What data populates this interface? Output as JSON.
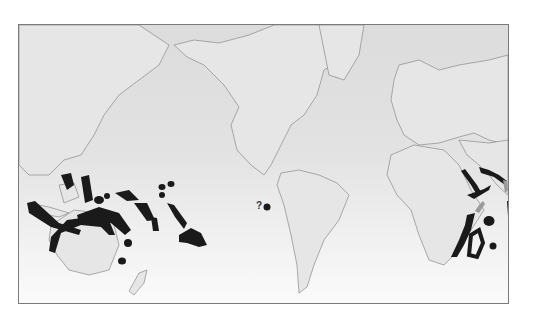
{
  "map": {
    "title": "",
    "projection": "Mercator world map, Pacific-centered",
    "style": "grayscale",
    "colors": {
      "ocean_top": "#dcdcdc",
      "ocean_bottom": "#fbfbfb",
      "land": "#e6e6e6",
      "coast": "#8a8a8a",
      "range": "#1a1a1a",
      "range_uncertain": "#9a9a9a"
    },
    "annotations": [
      {
        "label": "?",
        "near": "Galápagos / eastern Pacific"
      }
    ],
    "highlighted_regions": [
      "Philippines",
      "Indonesia / Borneo / Sulawesi",
      "New Guinea",
      "Northern Australia coast",
      "Micronesia",
      "Solomon Islands / Vanuatu",
      "New Caledonia",
      "Marshall Islands",
      "Line Islands",
      "French Polynesia",
      "Eastern Pacific (uncertain)",
      "Red Sea",
      "Persian Gulf",
      "East African coast",
      "Madagascar",
      "Mascarene Islands",
      "Maldives / Laccadives"
    ]
  }
}
